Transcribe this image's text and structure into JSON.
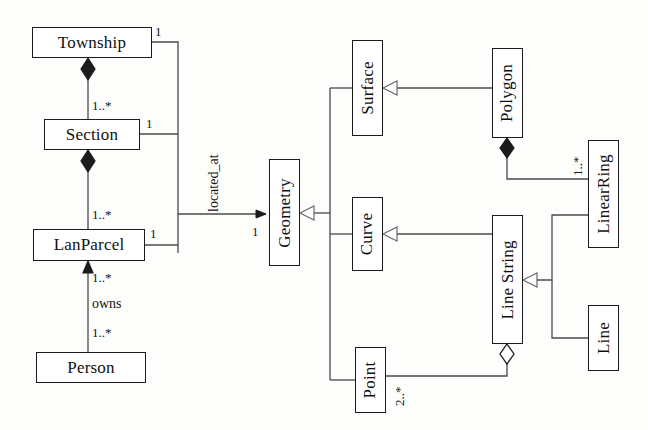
{
  "diagram": {
    "type": "uml-class-diagram",
    "classes": [
      {
        "id": "township",
        "name": "Township",
        "orientation": "horizontal",
        "x": 32,
        "y": 27,
        "w": 120,
        "h": 31
      },
      {
        "id": "section",
        "name": "Section",
        "orientation": "horizontal",
        "x": 44,
        "y": 119,
        "w": 96,
        "h": 31
      },
      {
        "id": "lanparcel",
        "name": "LanParcel",
        "orientation": "horizontal",
        "x": 33,
        "y": 229,
        "w": 112,
        "h": 32
      },
      {
        "id": "person",
        "name": "Person",
        "orientation": "horizontal",
        "x": 36,
        "y": 352,
        "w": 110,
        "h": 31
      },
      {
        "id": "geometry",
        "name": "Geometry",
        "orientation": "vertical",
        "x": 269,
        "y": 159,
        "w": 31,
        "h": 107
      },
      {
        "id": "surface",
        "name": "Surface",
        "orientation": "vertical",
        "x": 352,
        "y": 40,
        "w": 31,
        "h": 96
      },
      {
        "id": "curve",
        "name": "Curve",
        "orientation": "vertical",
        "x": 352,
        "y": 197,
        "w": 31,
        "h": 74
      },
      {
        "id": "point",
        "name": "Point",
        "orientation": "vertical",
        "x": 355,
        "y": 347,
        "w": 31,
        "h": 66
      },
      {
        "id": "polygon",
        "name": "Polygon",
        "orientation": "vertical",
        "x": 492,
        "y": 48,
        "w": 31,
        "h": 90
      },
      {
        "id": "linestring",
        "name": "Line String",
        "orientation": "vertical",
        "x": 492,
        "y": 215,
        "w": 31,
        "h": 129
      },
      {
        "id": "linearring",
        "name": "LinearRing",
        "orientation": "vertical",
        "x": 588,
        "y": 140,
        "w": 31,
        "h": 108
      },
      {
        "id": "line",
        "name": "Line",
        "orientation": "vertical",
        "x": 588,
        "y": 305,
        "w": 31,
        "h": 66
      }
    ],
    "relationships": [
      {
        "id": "township-section",
        "from": "Township",
        "to": "Section",
        "type": "composition",
        "source_multiplicity": "",
        "target_multiplicity": "1..*"
      },
      {
        "id": "section-lanparcel",
        "from": "Section",
        "to": "LanParcel",
        "type": "composition",
        "source_multiplicity": "",
        "target_multiplicity": "1..*"
      },
      {
        "id": "person-lanparcel",
        "from": "Person",
        "to": "LanParcel",
        "type": "association",
        "name": "owns",
        "source_multiplicity": "1..*",
        "target_multiplicity": "1..*"
      },
      {
        "id": "parcel-geometry",
        "from": "LanParcel",
        "to": "Geometry",
        "type": "association",
        "name": "located_at",
        "source_multiplicity": "1",
        "target_multiplicity": "1"
      },
      {
        "id": "surface-geometry",
        "from": "Surface",
        "to": "Geometry",
        "type": "generalization",
        "source_multiplicity": "",
        "target_multiplicity": ""
      },
      {
        "id": "curve-geometry",
        "from": "Curve",
        "to": "Geometry",
        "type": "generalization",
        "source_multiplicity": "",
        "target_multiplicity": ""
      },
      {
        "id": "point-geometry",
        "from": "Point",
        "to": "Geometry",
        "type": "generalization",
        "source_multiplicity": "",
        "target_multiplicity": ""
      },
      {
        "id": "polygon-surface",
        "from": "Polygon",
        "to": "Surface",
        "type": "generalization",
        "source_multiplicity": "",
        "target_multiplicity": ""
      },
      {
        "id": "linestring-curve",
        "from": "Line String",
        "to": "Curve",
        "type": "generalization",
        "source_multiplicity": "",
        "target_multiplicity": ""
      },
      {
        "id": "polygon-linearring",
        "from": "Polygon",
        "to": "LinearRing",
        "type": "composition",
        "source_multiplicity": "",
        "target_multiplicity": "1..*"
      },
      {
        "id": "linearring-ls",
        "from": "LinearRing",
        "to": "Line String",
        "type": "generalization",
        "source_multiplicity": "",
        "target_multiplicity": ""
      },
      {
        "id": "line-ls",
        "from": "Line",
        "to": "Line String",
        "type": "generalization",
        "source_multiplicity": "",
        "target_multiplicity": ""
      },
      {
        "id": "ls-point",
        "from": "Line String",
        "to": "Point",
        "type": "aggregation",
        "source_multiplicity": "",
        "target_multiplicity": "2..*"
      }
    ],
    "labels": {
      "township": "Township",
      "section": "Section",
      "lanparcel": "LanParcel",
      "person": "Person",
      "geometry": "Geometry",
      "surface": "Surface",
      "curve": "Curve",
      "point": "Point",
      "polygon": "Polygon",
      "linestring": "Line String",
      "linearring": "LinearRing",
      "line": "Line"
    },
    "annotations": {
      "township_one": "1",
      "section_star": "1..*",
      "section_one": "1",
      "lanparcel_star": "1..*",
      "lanparcel_one": "1",
      "located_at": "located_at",
      "geometry_one": "1",
      "owns_upper": "1..*",
      "owns_label": "owns",
      "owns_lower": "1..*",
      "linearring_star": "1..*",
      "point_star": "2..*"
    },
    "colors": {
      "stroke": "#1b1b1b",
      "line": "#4a4a4a",
      "fill": "#ffffff",
      "background": "#fdfdfc",
      "text": "#111111"
    }
  }
}
